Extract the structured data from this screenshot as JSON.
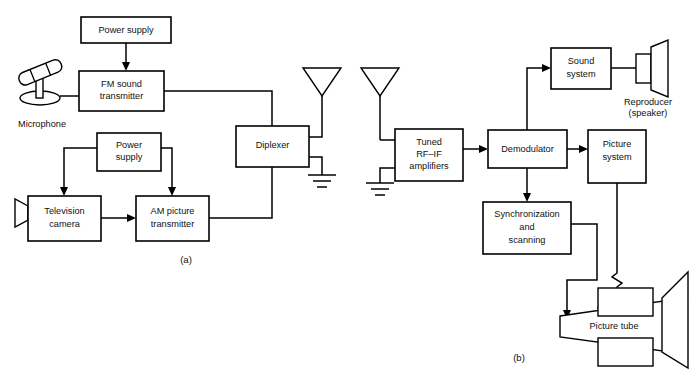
{
  "figure": {
    "panels": [
      {
        "id": "a",
        "label": "(a)",
        "x": 186,
        "y": 260,
        "description": "transmitter"
      },
      {
        "id": "b",
        "label": "(b)",
        "x": 519,
        "y": 358,
        "description": "receiver"
      }
    ]
  },
  "transmitter": {
    "blocks": [
      {
        "name": "power-supply-sound",
        "label": "Power supply",
        "lines": [
          "Power supply"
        ],
        "x": 81,
        "y": 17,
        "w": 90,
        "h": 26
      },
      {
        "name": "fm-sound-transmitter",
        "label": "FM sound transmitter",
        "lines": [
          "FM sound",
          "transmitter"
        ],
        "x": 79,
        "y": 71,
        "w": 85,
        "h": 40
      },
      {
        "name": "power-supply-picture",
        "label": "Power supply",
        "lines": [
          "Power",
          "supply"
        ],
        "x": 97,
        "y": 133,
        "w": 64,
        "h": 38
      },
      {
        "name": "television-camera",
        "label": "Television camera",
        "lines": [
          "Television",
          "camera"
        ],
        "x": 28,
        "y": 196,
        "w": 73,
        "h": 45
      },
      {
        "name": "am-picture-transmitter",
        "label": "AM picture transmitter",
        "lines": [
          "AM picture",
          "transmitter"
        ],
        "x": 136,
        "y": 196,
        "w": 73,
        "h": 45
      },
      {
        "name": "diplexer",
        "label": "Diplexer",
        "lines": [
          "Diplexer"
        ],
        "x": 236,
        "y": 126,
        "w": 73,
        "h": 41
      }
    ],
    "symbols": [
      {
        "name": "microphone",
        "label": "Microphone",
        "caption_x": 42,
        "caption_y": 124
      },
      {
        "name": "transmit-antenna",
        "label": "antenna",
        "x": 322,
        "y": 68
      },
      {
        "name": "transmit-ground",
        "label": "ground",
        "x": 322,
        "y": 175
      }
    ]
  },
  "receiver": {
    "blocks": [
      {
        "name": "tuned-rf-if-amplifiers",
        "label": "Tuned RF-IF amplifiers",
        "lines": [
          "Tuned",
          "RF–IF",
          "amplifiers"
        ],
        "x": 395,
        "y": 129,
        "w": 68,
        "h": 52
      },
      {
        "name": "demodulator",
        "label": "Demodulator",
        "lines": [
          "Demodulator"
        ],
        "x": 488,
        "y": 130,
        "w": 79,
        "h": 38
      },
      {
        "name": "sound-system",
        "label": "Sound system",
        "lines": [
          "Sound",
          "system"
        ],
        "x": 551,
        "y": 48,
        "w": 60,
        "h": 41
      },
      {
        "name": "picture-system",
        "label": "Picture system",
        "lines": [
          "Picture",
          "system"
        ],
        "x": 588,
        "y": 130,
        "w": 58,
        "h": 53
      },
      {
        "name": "synchronization-and-scanning",
        "label": "Synchronization and scanning",
        "lines": [
          "Synchronization",
          "and",
          "scanning"
        ],
        "x": 483,
        "y": 202,
        "w": 88,
        "h": 52
      },
      {
        "name": "picture-tube",
        "label": "Picture tube",
        "lines": [
          "Picture tube"
        ],
        "x": 565,
        "y": 296,
        "w": 128,
        "h": 68
      }
    ],
    "symbols": [
      {
        "name": "receive-antenna",
        "label": "antenna",
        "x": 380,
        "y": 68
      },
      {
        "name": "receive-ground",
        "label": "ground",
        "x": 380,
        "y": 183
      },
      {
        "name": "reproducer-speaker",
        "label": "Reproducer (speaker)",
        "lines": [
          "Reproducer",
          "(speaker)"
        ],
        "caption_x": 648,
        "caption_y": 104
      }
    ]
  }
}
